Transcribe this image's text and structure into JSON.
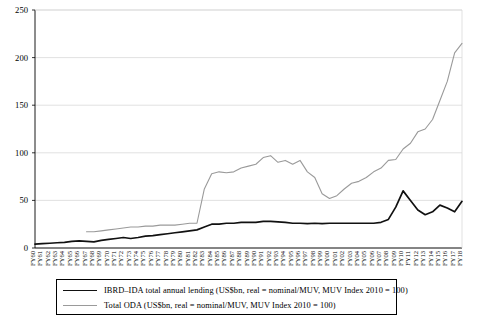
{
  "chart_data": {
    "type": "line",
    "title": "",
    "xlabel": "",
    "ylabel": "",
    "ylim": [
      0,
      250
    ],
    "yticks": [
      0,
      50,
      100,
      150,
      200,
      250
    ],
    "grid": true,
    "legend_position": "below-axes",
    "categories": [
      "FY60",
      "FY61",
      "FY62",
      "FY63",
      "FY64",
      "FY65",
      "FY66",
      "FY67",
      "FY68",
      "FY69",
      "FY70",
      "FY71",
      "FY72",
      "FY73",
      "FY74",
      "FY75",
      "FY76",
      "FY77",
      "FY78",
      "FY79",
      "FY80",
      "FY81",
      "FY82",
      "FY83",
      "FY84",
      "FY85",
      "FY86",
      "FY87",
      "FY88",
      "FY89",
      "FY90",
      "FY91",
      "FY92",
      "FY93",
      "FY94",
      "FY95",
      "FY96",
      "FY97",
      "FY98",
      "FY99",
      "FY00",
      "FY01",
      "FY02",
      "FY03",
      "FY04",
      "FY05",
      "FY06",
      "FY07",
      "FY08",
      "FY09",
      "FY10",
      "FY11",
      "FY12",
      "FY13",
      "FY14",
      "FY15",
      "FY16",
      "FY17",
      "FY18"
    ],
    "series": [
      {
        "name": "IBRD–IDA total annual lending (US$bn, real = nominal/MUV, MUV Index 2010 = 100)",
        "color": "#111111",
        "width": 1.7,
        "values": [
          4,
          4.5,
          5,
          5.5,
          6,
          7,
          7.5,
          7,
          6.5,
          8,
          9,
          10,
          11,
          10,
          11,
          12.5,
          13,
          14,
          15,
          16,
          17,
          18,
          19,
          22,
          25,
          25,
          26,
          26,
          27,
          27,
          27,
          28,
          28,
          27.5,
          27,
          26,
          26,
          25.5,
          26,
          25.5,
          26,
          26,
          26,
          26,
          26,
          26,
          26,
          27,
          30,
          43,
          60,
          50,
          40,
          35,
          38,
          45,
          42,
          38,
          49
        ]
      },
      {
        "name": "Total ODA (US$bn, real = nominal/MUV, MUV Index 2010 = 100)",
        "color": "#9a9a9a",
        "width": 1.1,
        "start_index": 7,
        "values": [
          null,
          null,
          null,
          null,
          null,
          null,
          null,
          17,
          17,
          18,
          19,
          20,
          21,
          22,
          22,
          23,
          23,
          24,
          24,
          24,
          25,
          26,
          26,
          62,
          78,
          80,
          79,
          80,
          84,
          86,
          88,
          95,
          97,
          90,
          92,
          88,
          92,
          80,
          74,
          57,
          52,
          55,
          62,
          68,
          70,
          74,
          80,
          84,
          92,
          93,
          104,
          110,
          122,
          125,
          135,
          155,
          175,
          205,
          215
        ]
      }
    ]
  },
  "legend": {
    "entries": [
      {
        "label": "IBRD–IDA total annual lending (US$bn, real = nominal/MUV, MUV Index 2010 = 100)",
        "swatch": "black-line"
      },
      {
        "label": "Total ODA (US$bn, real = nominal/MUV, MUV Index 2010 = 100)",
        "swatch": "gray-line"
      }
    ]
  },
  "axes": {
    "y_tick_labels": [
      "250",
      "200",
      "150",
      "100",
      "50",
      "0"
    ],
    "x_tick_labels": [
      "FY60",
      "FY61",
      "FY62",
      "FY63",
      "FY64",
      "FY65",
      "FY66",
      "FY67",
      "FY68",
      "FY69",
      "FY70",
      "FY71",
      "FY72",
      "FY73",
      "FY74",
      "FY75",
      "FY76",
      "FY77",
      "FY78",
      "FY79",
      "FY80",
      "FY81",
      "FY82",
      "FY83",
      "FY84",
      "FY85",
      "FY86",
      "FY87",
      "FY88",
      "FY89",
      "FY90",
      "FY91",
      "FY92",
      "FY93",
      "FY94",
      "FY95",
      "FY96",
      "FY97",
      "FY98",
      "FY99",
      "FY00",
      "FY01",
      "FY02",
      "FY03",
      "FY04",
      "FY05",
      "FY06",
      "FY07",
      "FY08",
      "FY09",
      "FY10",
      "FY11",
      "FY12",
      "FY13",
      "FY14",
      "FY15",
      "FY16",
      "FY17",
      "FY18"
    ]
  },
  "colors": {
    "grid": "#d9d9d9",
    "axis": "#000000",
    "series_black": "#111111",
    "series_gray": "#9a9a9a",
    "background": "#ffffff"
  }
}
